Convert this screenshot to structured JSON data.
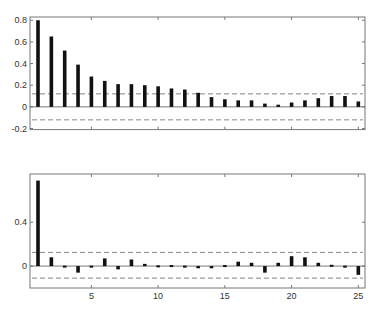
{
  "chart_data": [
    {
      "type": "bar",
      "title": "",
      "xlabel": "",
      "ylabel": "",
      "x": [
        1,
        2,
        3,
        4,
        5,
        6,
        7,
        8,
        9,
        10,
        11,
        12,
        13,
        14,
        15,
        16,
        17,
        18,
        19,
        20,
        21,
        22,
        23,
        24,
        25
      ],
      "values": [
        0.8,
        0.65,
        0.52,
        0.39,
        0.28,
        0.24,
        0.21,
        0.21,
        0.2,
        0.19,
        0.17,
        0.16,
        0.13,
        0.09,
        0.07,
        0.06,
        0.06,
        0.03,
        0.02,
        0.04,
        0.06,
        0.08,
        0.1,
        0.1,
        0.05
      ],
      "confidence_bounds": [
        0.12,
        -0.12
      ],
      "ylim": [
        -0.21,
        0.83
      ],
      "xlim": [
        0.4,
        25.5
      ],
      "yticks": [
        -0.2,
        0,
        0.2,
        0.4,
        0.6,
        0.8
      ],
      "ytick_labels": [
        "-0.2",
        "0",
        "0.2",
        "0.4",
        "0.6",
        "0.8"
      ],
      "xticks": [
        5,
        10,
        15,
        20,
        25
      ],
      "xtick_labels": [],
      "grid": false,
      "legend": null
    },
    {
      "type": "bar",
      "title": "",
      "xlabel": "",
      "ylabel": "",
      "x": [
        1,
        2,
        3,
        4,
        5,
        6,
        7,
        8,
        9,
        10,
        11,
        12,
        13,
        14,
        15,
        16,
        17,
        18,
        19,
        20,
        21,
        22,
        23,
        24,
        25
      ],
      "values": [
        0.78,
        0.08,
        -0.01,
        -0.06,
        -0.01,
        0.07,
        -0.03,
        0.06,
        0.02,
        -0.005,
        0.0,
        -0.01,
        -0.02,
        -0.02,
        0.0,
        0.04,
        0.03,
        -0.06,
        0.03,
        0.09,
        0.08,
        0.03,
        0.005,
        -0.01,
        -0.08
      ],
      "confidence_bounds": [
        0.125,
        -0.11
      ],
      "ylim": [
        -0.2,
        0.84
      ],
      "xlim": [
        0.4,
        25.5
      ],
      "yticks": [
        0,
        0.4
      ],
      "ytick_labels": [
        "0",
        "0.4"
      ],
      "xticks": [
        5,
        10,
        15,
        20,
        25
      ],
      "xtick_labels": [
        "5",
        "10",
        "15",
        "20",
        "25"
      ],
      "grid": false,
      "legend": null
    }
  ],
  "style": {
    "bar_color": "#111111",
    "axis_color": "#777777",
    "dash_color": "#666666",
    "zero_color": "#555555"
  }
}
